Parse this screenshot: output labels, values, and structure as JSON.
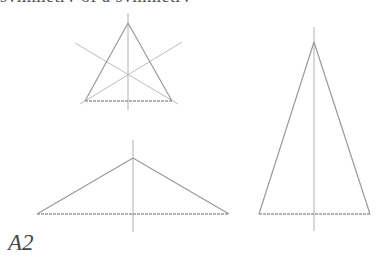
{
  "top_text": "symmetry of a symmetry",
  "label": "A2",
  "colors": {
    "stroke": "#9a9a9a",
    "axis": "#a8a8a8",
    "label": "#444444"
  },
  "figures": [
    {
      "name": "equilateral-triangle",
      "apex": [
        128,
        23
      ],
      "base_left": [
        85,
        101
      ],
      "base_right": [
        172,
        101
      ],
      "axis": [
        [
          128,
          13
        ],
        [
          128,
          110
        ]
      ],
      "bisectors": [
        [
          [
            75,
            43
          ],
          [
            178,
            104
          ]
        ],
        [
          [
            182,
            42
          ],
          [
            80,
            104
          ]
        ]
      ]
    },
    {
      "name": "obtuse-isosceles-triangle",
      "apex": [
        133,
        158
      ],
      "base_left": [
        37,
        214
      ],
      "base_right": [
        229,
        214
      ],
      "axis": [
        [
          133,
          140
        ],
        [
          133,
          232
        ]
      ]
    },
    {
      "name": "tall-isosceles-triangle",
      "apex": [
        314,
        42
      ],
      "base_left": [
        259,
        214
      ],
      "base_right": [
        370,
        214
      ],
      "axis": [
        [
          314,
          27
        ],
        [
          314,
          231
        ]
      ]
    }
  ]
}
